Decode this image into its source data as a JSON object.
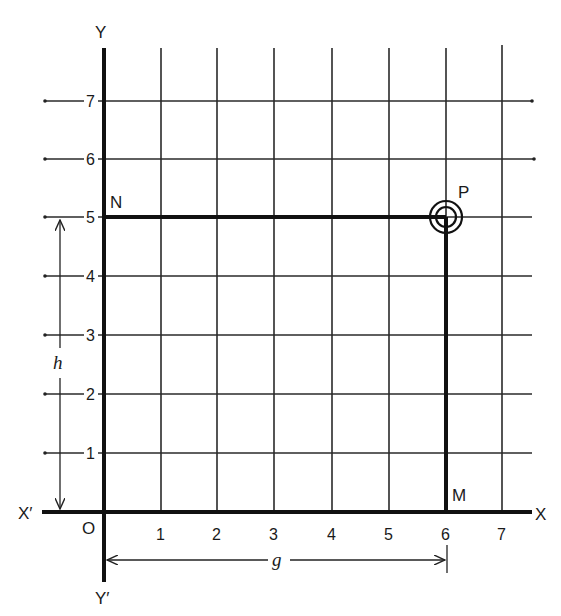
{
  "diagram": {
    "axes": {
      "x_positive_label": "X",
      "x_negative_label": "X′",
      "y_positive_label": "Y",
      "y_negative_label": "Y′",
      "origin_label": "O"
    },
    "x_ticks": [
      "1",
      "2",
      "3",
      "4",
      "5",
      "6",
      "7"
    ],
    "y_ticks": [
      "1",
      "2",
      "3",
      "4",
      "5",
      "6",
      "7"
    ],
    "points": {
      "P": {
        "label": "P",
        "x": 6,
        "y": 5
      },
      "N": {
        "label": "N",
        "x": 0,
        "y": 5
      },
      "M": {
        "label": "M",
        "x": 6,
        "y": 0
      }
    },
    "dimensions": {
      "horizontal": {
        "label": "g",
        "from": 0,
        "to": 6
      },
      "vertical": {
        "label": "h",
        "from": 0,
        "to": 5
      }
    },
    "colors": {
      "ink": "#111111",
      "paper": "#ffffff"
    }
  }
}
